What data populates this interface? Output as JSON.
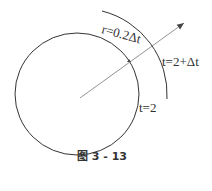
{
  "figure": {
    "caption": "图 3 - 13",
    "labels": {
      "radius": "r=0.2Δt",
      "outer": "t=2+Δt",
      "inner": "t=2"
    },
    "colors": {
      "stroke": "#333333",
      "arrow": "#666666",
      "background": "#ffffff"
    }
  }
}
